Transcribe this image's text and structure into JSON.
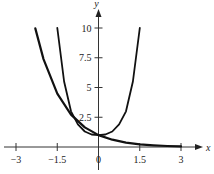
{
  "chart_data": {
    "type": "line",
    "title": "",
    "xlabel": "x",
    "ylabel": "y",
    "xlim": [
      -3,
      3
    ],
    "ylim": [
      0,
      10
    ],
    "grid": false,
    "x_ticks": [
      {
        "value": -3,
        "label": "−3"
      },
      {
        "value": -1.5,
        "label": "−1.5"
      },
      {
        "value": 0,
        "label": "0"
      },
      {
        "value": 1.5,
        "label": "1.5"
      },
      {
        "value": 3,
        "label": "3"
      }
    ],
    "y_ticks": [
      {
        "value": 2.5,
        "label": "2.5"
      },
      {
        "value": 5,
        "label": "5"
      },
      {
        "value": 7.5,
        "label": "7.5"
      },
      {
        "value": 10,
        "label": "10"
      }
    ],
    "series": [
      {
        "name": "decreasing exponential",
        "x": [
          -2.3,
          -2,
          -1.5,
          -1,
          -0.5,
          0,
          0.5,
          1,
          1.5,
          2,
          2.5,
          3
        ],
        "y": [
          9.97,
          7.39,
          4.48,
          2.72,
          1.65,
          1.0,
          0.61,
          0.37,
          0.22,
          0.14,
          0.08,
          0.05
        ]
      },
      {
        "name": "U-shaped curve",
        "x": [
          -1.5,
          -1.25,
          -1,
          -0.75,
          -0.5,
          -0.25,
          0,
          0.25,
          0.5,
          0.75,
          1,
          1.25,
          1.5
        ],
        "y": [
          10,
          5.5,
          3.0,
          1.9,
          1.3,
          1.05,
          1.0,
          1.05,
          1.3,
          1.9,
          3.0,
          5.5,
          10
        ]
      }
    ]
  }
}
